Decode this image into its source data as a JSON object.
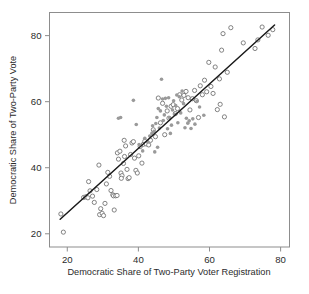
{
  "chart_data": {
    "type": "scatter",
    "title": "",
    "xlabel": "Democratic Share of Two-Party Voter Registration",
    "ylabel": "Democratic Share of Two-Party Vote",
    "xlim": [
      15.0,
      82.5
    ],
    "ylim": [
      16.0,
      87.0
    ],
    "xticks": [
      20,
      40,
      60,
      80
    ],
    "yticks": [
      20,
      40,
      60,
      80
    ],
    "xtick_labels": [
      "20",
      "40",
      "60",
      "80"
    ],
    "ytick_labels": [
      "20",
      "40",
      "60",
      "80"
    ],
    "grid": false,
    "legend": "none",
    "frame": "box",
    "colors": {
      "open_marker_stroke": "#6e6e6e",
      "open_marker_fill": "#ffffff",
      "filled_marker": "#9a9a9a",
      "fit_line": "#1a1a1a",
      "axis": "#8d8d8d",
      "text": "#2b2b2b",
      "background": "#ffffff"
    },
    "series": [
      {
        "name": "open-circles",
        "marker": "open-circle",
        "radius": 2.1,
        "points": [
          [
            18.2,
            26.0
          ],
          [
            18.9,
            20.5
          ],
          [
            24.6,
            31.0
          ],
          [
            25.2,
            31.2
          ],
          [
            25.8,
            30.9
          ],
          [
            26.4,
            33.0
          ],
          [
            26.0,
            35.8
          ],
          [
            27.1,
            31.4
          ],
          [
            27.6,
            29.5
          ],
          [
            28.3,
            33.4
          ],
          [
            28.9,
            40.8
          ],
          [
            29.4,
            27.6
          ],
          [
            29.1,
            25.8
          ],
          [
            29.8,
            26.2
          ],
          [
            30.2,
            25.5
          ],
          [
            30.6,
            29.2
          ],
          [
            31.0,
            35.1
          ],
          [
            31.4,
            38.6
          ],
          [
            31.9,
            37.4
          ],
          [
            32.3,
            33.1
          ],
          [
            32.8,
            31.8
          ],
          [
            33.2,
            27.2
          ],
          [
            33.0,
            31.5
          ],
          [
            33.6,
            31.5
          ],
          [
            34.0,
            31.6
          ],
          [
            34.4,
            42.6
          ],
          [
            34.1,
            44.5
          ],
          [
            34.8,
            45.0
          ],
          [
            35.1,
            38.4
          ],
          [
            35.4,
            37.6
          ],
          [
            35.2,
            36.8
          ],
          [
            35.8,
            41.3
          ],
          [
            36.1,
            43.4
          ],
          [
            36.4,
            46.6
          ],
          [
            36.0,
            48.3
          ],
          [
            36.8,
            39.5
          ],
          [
            37.1,
            36.7
          ],
          [
            37.4,
            37.0
          ],
          [
            37.8,
            44.0
          ],
          [
            38.2,
            47.5
          ],
          [
            38.6,
            47.9
          ],
          [
            38.9,
            42.9
          ],
          [
            39.3,
            39.2
          ],
          [
            39.7,
            38.4
          ],
          [
            40.1,
            43.6
          ],
          [
            40.5,
            46.4
          ],
          [
            41.0,
            41.4
          ],
          [
            41.4,
            47.1
          ],
          [
            41.8,
            48.0
          ],
          [
            42.2,
            47.2
          ],
          [
            42.9,
            46.9
          ],
          [
            43.4,
            48.3
          ],
          [
            44.2,
            51.5
          ],
          [
            44.8,
            49.4
          ],
          [
            45.6,
            61.1
          ],
          [
            46.2,
            53.6
          ],
          [
            46.8,
            59.5
          ],
          [
            47.4,
            50.0
          ],
          [
            48.1,
            57.2
          ],
          [
            48.6,
            55.0
          ],
          [
            49.2,
            58.6
          ],
          [
            49.8,
            59.1
          ],
          [
            50.4,
            56.4
          ],
          [
            51.0,
            57.9
          ],
          [
            51.6,
            62.1
          ],
          [
            52.2,
            60.5
          ],
          [
            52.8,
            61.9
          ],
          [
            53.4,
            63.1
          ],
          [
            54.0,
            61.2
          ],
          [
            54.5,
            57.5
          ],
          [
            55.2,
            60.9
          ],
          [
            55.8,
            63.4
          ],
          [
            56.3,
            60.3
          ],
          [
            56.9,
            55.2
          ],
          [
            57.4,
            64.8
          ],
          [
            58.0,
            62.1
          ],
          [
            58.6,
            66.5
          ],
          [
            59.2,
            63.0
          ],
          [
            59.8,
            71.9
          ],
          [
            60.4,
            64.6
          ],
          [
            61.0,
            62.5
          ],
          [
            61.6,
            70.5
          ],
          [
            62.2,
            57.6
          ],
          [
            62.8,
            66.9
          ],
          [
            63.4,
            75.6
          ],
          [
            63.0,
            59.2
          ],
          [
            63.8,
            80.6
          ],
          [
            64.2,
            55.4
          ],
          [
            65.0,
            68.9
          ],
          [
            66.0,
            82.4
          ],
          [
            69.5,
            77.8
          ],
          [
            72.8,
            76.1
          ],
          [
            73.6,
            78.7
          ],
          [
            74.8,
            82.6
          ],
          [
            76.5,
            80.1
          ],
          [
            77.8,
            81.8
          ]
        ]
      },
      {
        "name": "filled-dots",
        "marker": "filled-circle",
        "radius": 1.8,
        "points": [
          [
            34.4,
            55.0
          ],
          [
            35.0,
            55.2
          ],
          [
            38.6,
            60.4
          ],
          [
            39.4,
            53.1
          ],
          [
            41.8,
            48.9
          ],
          [
            42.6,
            47.8
          ],
          [
            43.2,
            49.6
          ],
          [
            43.8,
            50.4
          ],
          [
            44.0,
            52.7
          ],
          [
            44.4,
            51.0
          ],
          [
            44.9,
            53.4
          ],
          [
            45.2,
            55.2
          ],
          [
            45.6,
            57.9
          ],
          [
            45.9,
            52.0
          ],
          [
            46.2,
            57.2
          ],
          [
            46.5,
            66.8
          ],
          [
            46.8,
            60.8
          ],
          [
            47.0,
            54.3
          ],
          [
            47.3,
            56.0
          ],
          [
            47.6,
            61.0
          ],
          [
            47.9,
            58.6
          ],
          [
            48.2,
            51.8
          ],
          [
            48.5,
            61.2
          ],
          [
            48.8,
            55.1
          ],
          [
            49.0,
            50.4
          ],
          [
            49.3,
            52.9
          ],
          [
            49.6,
            57.5
          ],
          [
            49.9,
            60.3
          ],
          [
            50.2,
            56.2
          ],
          [
            50.5,
            58.8
          ],
          [
            50.8,
            62.0
          ],
          [
            51.1,
            53.6
          ],
          [
            51.5,
            61.5
          ],
          [
            51.9,
            56.6
          ],
          [
            52.3,
            63.2
          ],
          [
            52.7,
            59.4
          ],
          [
            53.1,
            52.1
          ],
          [
            53.5,
            55.0
          ],
          [
            53.9,
            53.5
          ],
          [
            54.3,
            54.2
          ],
          [
            54.8,
            51.9
          ],
          [
            55.3,
            54.8
          ],
          [
            55.9,
            53.2
          ],
          [
            56.5,
            60.1
          ],
          [
            57.2,
            58.4
          ],
          [
            58.4,
            55.9
          ],
          [
            44.6,
            44.8
          ],
          [
            45.4,
            46.2
          ],
          [
            41.2,
            45.1
          ],
          [
            40.2,
            47.0
          ]
        ]
      }
    ],
    "fit_line": {
      "name": "regression-line",
      "x0": 18.0,
      "y0": 24.4,
      "x1": 78.3,
      "y1": 83.2
    }
  }
}
